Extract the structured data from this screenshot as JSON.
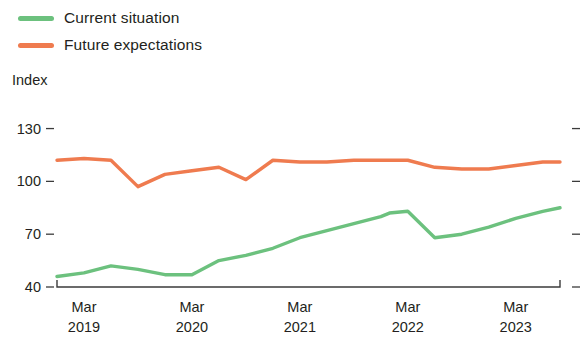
{
  "chart_data": {
    "type": "line",
    "title": "",
    "xlabel": "",
    "ylabel": "Index",
    "ylim": [
      40,
      136
    ],
    "yticks": [
      40,
      70,
      100,
      130
    ],
    "grid": false,
    "legend_position": "top-left",
    "x_tick_labels": [
      {
        "month": "Mar",
        "year": "2019"
      },
      {
        "month": "Mar",
        "year": "2020"
      },
      {
        "month": "Mar",
        "year": "2021"
      },
      {
        "month": "Mar",
        "year": "2022"
      },
      {
        "month": "Mar",
        "year": "2023"
      }
    ],
    "x_tick_values": [
      2019.17,
      2020.17,
      2021.17,
      2022.17,
      2023.17
    ],
    "x_range": [
      2018.92,
      2023.58
    ],
    "series": [
      {
        "name": "Current situation",
        "color": "#6cc17e",
        "x": [
          2018.92,
          2019.17,
          2019.42,
          2019.67,
          2019.92,
          2020.17,
          2020.42,
          2020.67,
          2020.92,
          2021.17,
          2021.42,
          2021.67,
          2021.92,
          2022.0,
          2022.17,
          2022.42,
          2022.67,
          2022.92,
          2023.17,
          2023.42,
          2023.58
        ],
        "values": [
          46,
          48,
          52,
          50,
          47,
          47,
          55,
          58,
          62,
          68,
          72,
          76,
          80,
          82,
          83,
          68,
          70,
          74,
          79,
          83,
          85
        ]
      },
      {
        "name": "Future expectations",
        "color": "#ef7b4f",
        "x": [
          2018.92,
          2019.17,
          2019.42,
          2019.67,
          2019.92,
          2020.17,
          2020.42,
          2020.67,
          2020.92,
          2021.17,
          2021.42,
          2021.67,
          2021.92,
          2022.17,
          2022.42,
          2022.67,
          2022.92,
          2023.17,
          2023.42,
          2023.58
        ],
        "values": [
          112,
          113,
          112,
          97,
          104,
          106,
          108,
          101,
          112,
          111,
          111,
          112,
          112,
          112,
          108,
          107,
          107,
          109,
          111,
          111
        ]
      }
    ]
  },
  "legend": {
    "items": [
      {
        "label": "Current situation",
        "color": "#6cc17e"
      },
      {
        "label": "Future expectations",
        "color": "#ef7b4f"
      }
    ]
  },
  "axis": {
    "y_title": "Index"
  }
}
